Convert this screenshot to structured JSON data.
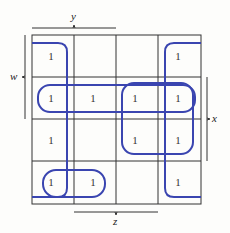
{
  "kmap": {
    "labels": {
      "y": "y",
      "w": "w",
      "x": "x",
      "z": "z"
    },
    "grid": [
      [
        "1",
        "",
        "",
        "1"
      ],
      [
        "1",
        "1",
        "1",
        "1"
      ],
      [
        "1",
        "",
        "1",
        "1"
      ],
      [
        "1",
        "1",
        "",
        "1"
      ]
    ],
    "loop_color": "#3a45b0",
    "grid_color": "#333333"
  }
}
